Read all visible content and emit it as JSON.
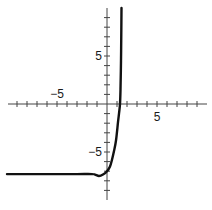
{
  "chart_data": {
    "type": "line",
    "title": "",
    "xlabel": "",
    "ylabel": "",
    "xlim": [
      -10,
      10
    ],
    "ylim": [
      -10,
      10
    ],
    "grid": false,
    "legend": null,
    "axes": {
      "x_tick_step": 1,
      "y_tick_step": 1,
      "x_tick_labels": [
        {
          "value": -5,
          "label": "−5"
        },
        {
          "value": 5,
          "label": "5"
        }
      ],
      "y_tick_labels": [
        {
          "value": 5,
          "label": "5"
        },
        {
          "value": -5,
          "label": "−5"
        }
      ]
    },
    "series": [
      {
        "name": "f(x)",
        "color": "#111111",
        "x": [
          -10,
          -6,
          -3,
          -1.5,
          -1.2,
          -0.8,
          -0.4,
          0,
          0.3,
          0.5,
          0.7,
          0.9,
          1.1,
          1.2,
          1.3,
          1.35,
          1.4,
          1.43,
          1.45
        ],
        "y": [
          -7.3,
          -7.3,
          -7.3,
          -7.3,
          -7.35,
          -7.5,
          -7.35,
          -7.0,
          -6.5,
          -5.8,
          -4.9,
          -3.8,
          -1.9,
          -1.0,
          0,
          1.5,
          4.5,
          7.5,
          10
        ]
      }
    ],
    "annotations": []
  }
}
